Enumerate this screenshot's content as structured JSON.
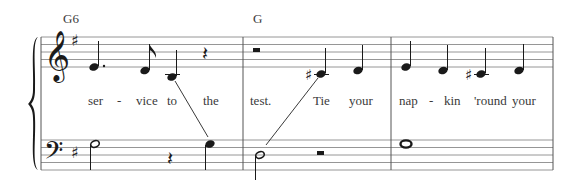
{
  "score": {
    "key_signature": "G major (1 sharp)",
    "chords": [
      {
        "label": "G6",
        "x": 63
      },
      {
        "label": "G",
        "x": 257
      }
    ],
    "treble_staff": {
      "clef": "treble",
      "lines_y": [
        37,
        44.5,
        52,
        59.5,
        67
      ]
    },
    "bass_staff": {
      "clef": "bass",
      "lines_y": [
        140,
        147.5,
        155,
        162.5,
        170
      ]
    },
    "system": {
      "left_x": 41,
      "right_x": 553,
      "barlines_x": [
        41,
        243,
        391,
        553
      ]
    },
    "lyrics": [
      {
        "text": "ser",
        "x": 99
      },
      {
        "text": "-",
        "x": 120
      },
      {
        "text": "vice",
        "x": 145
      },
      {
        "text": "to",
        "x": 172
      },
      {
        "text": "the",
        "x": 209
      },
      {
        "text": "test.",
        "x": 262
      },
      {
        "text": "Tie",
        "x": 323
      },
      {
        "text": "your",
        "x": 366
      },
      {
        "text": "nap",
        "x": 411
      },
      {
        "text": "-",
        "x": 432
      },
      {
        "text": "kin",
        "x": 455
      },
      {
        "text": "'round",
        "x": 489
      },
      {
        "text": "your",
        "x": 524
      }
    ],
    "measures": [
      {
        "number": 1,
        "chord": "G6",
        "treble": [
          "E4 dotted quarter",
          "D4 eighth",
          "B3 quarter",
          "quarter rest"
        ],
        "bass": [
          "G2 half",
          "quarter rest",
          "G3 quarter"
        ]
      },
      {
        "number": 2,
        "chord": "G",
        "treble": [
          "half rest",
          "C#4 quarter",
          "D4 quarter"
        ],
        "bass": [
          "D3 half",
          "half rest"
        ]
      },
      {
        "number": 3,
        "chord": "",
        "treble": [
          "E4 quarter",
          "D4 quarter",
          "C#4 quarter",
          "D4 quarter"
        ],
        "bass": [
          "G2 whole"
        ]
      }
    ]
  }
}
